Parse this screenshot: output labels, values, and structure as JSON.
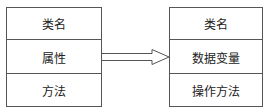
{
  "diagram": {
    "left_box": {
      "rows": [
        "类名",
        "属性",
        "方法"
      ]
    },
    "right_box": {
      "rows": [
        "类名",
        "数据变量",
        "操作方法"
      ]
    },
    "arrow": {
      "style": "hollow-double-line",
      "direction": "left-to-right"
    },
    "colors": {
      "stroke": "#555555",
      "text": "#222222",
      "background": "#ffffff"
    }
  }
}
